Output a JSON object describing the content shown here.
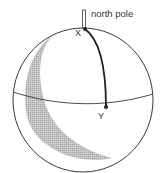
{
  "diagram": {
    "type": "globe-with-meridian-arc",
    "labels": {
      "north_pole": "north pole",
      "point_x": "X",
      "point_y": "Y"
    },
    "colors": {
      "outline": "#3a3a3a",
      "arc": "#222222",
      "shadow": "#b8b8b8",
      "text": "#333333"
    }
  }
}
